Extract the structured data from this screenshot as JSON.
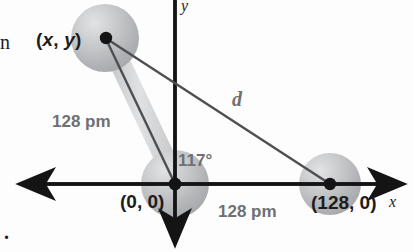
{
  "figure": {
    "type": "molecular-geometry-diagram",
    "background_color": "#fdfdfd",
    "atom_color": "#b9bbbd",
    "bond_band_color": "#d2d4d6",
    "line_color": "#4d4f52",
    "axis_color": "#141414",
    "label_gray": "#6e7073",
    "label_dark": "#1c1c1c"
  },
  "axes": {
    "x_label": "x",
    "y_label": "y",
    "origin_px": {
      "x": 175,
      "y": 184
    }
  },
  "labels": {
    "point_xy": "(x, y)",
    "point_xy_open": "(",
    "point_xy_x": "x",
    "point_xy_comma": ", ",
    "point_xy_y": "y",
    "point_xy_close": ")",
    "point_origin": "(0, 0)",
    "point_right": "(128, 0)",
    "bond_length_left": "128 pm",
    "bond_length_bottom": "128 pm",
    "bond_angle": "117°",
    "distance": "d"
  },
  "atoms": [
    {
      "name": "atom-upper-left",
      "cx": 105,
      "cy": 38,
      "r": 34,
      "dot": true
    },
    {
      "name": "atom-origin",
      "cx": 175,
      "cy": 184,
      "r": 34,
      "dot": true
    },
    {
      "name": "atom-right",
      "cx": 330,
      "cy": 184,
      "r": 31,
      "dot": true
    }
  ],
  "page_artifacts": {
    "left_cut_letter": "n",
    "bottom_left_period": "."
  }
}
